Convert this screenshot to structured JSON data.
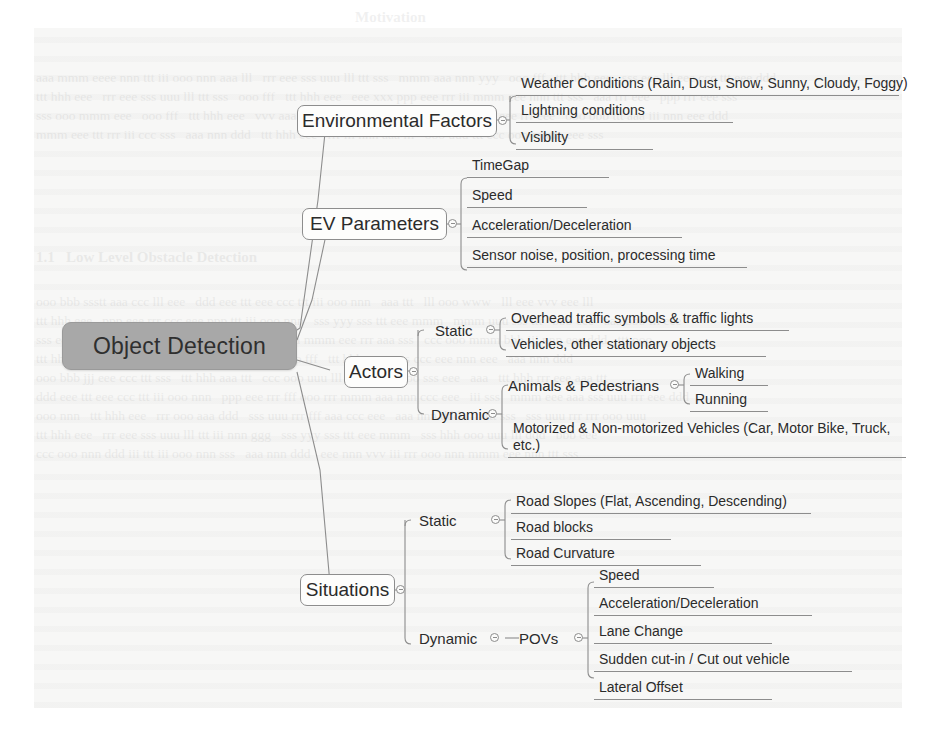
{
  "diagram": {
    "type": "mind-map",
    "root": {
      "label": "Object Detection"
    },
    "branches": [
      {
        "label": "Environmental Factors",
        "children": [
          {
            "label": "Weather Conditions (Rain, Dust, Snow, Sunny, Cloudy, Foggy)"
          },
          {
            "label": "Lightning conditions"
          },
          {
            "label": "Visiblity"
          }
        ]
      },
      {
        "label": "EV Parameters",
        "children": [
          {
            "label": "TimeGap"
          },
          {
            "label": "Speed"
          },
          {
            "label": "Acceleration/Deceleration"
          },
          {
            "label": "Sensor noise, position, processing time"
          }
        ]
      },
      {
        "label": "Actors",
        "groups": [
          {
            "label": "Static",
            "children": [
              {
                "label": "Overhead traffic symbols & traffic lights"
              },
              {
                "label": "Vehicles, other stationary objects"
              }
            ]
          },
          {
            "label": "Dynamic",
            "children": [
              {
                "label": "Animals & Pedestrians",
                "children": [
                  {
                    "label": "Walking"
                  },
                  {
                    "label": "Running"
                  }
                ]
              },
              {
                "label": "Motorized & Non-motorized Vehicles (Car, Motor Bike, Truck, etc.)"
              }
            ]
          }
        ]
      },
      {
        "label": "Situations",
        "groups": [
          {
            "label": "Static",
            "children": [
              {
                "label": "Road Slopes (Flat, Ascending, Descending)"
              },
              {
                "label": "Road blocks"
              },
              {
                "label": "Road Curvature"
              }
            ]
          },
          {
            "label": "Dynamic",
            "sublabel": "POVs",
            "children": [
              {
                "label": "Speed"
              },
              {
                "label": "Acceleration/Deceleration"
              },
              {
                "label": "Lane Change"
              },
              {
                "label": "Sudden cut-in / Cut out vehicle"
              },
              {
                "label": "Lateral Offset"
              }
            ]
          }
        ]
      }
    ]
  },
  "colors": {
    "root_fill": "#a8a8a8",
    "node_stroke": "#8d8d8d",
    "text": "#2b2b2b",
    "paper": "#f7f7f6"
  }
}
